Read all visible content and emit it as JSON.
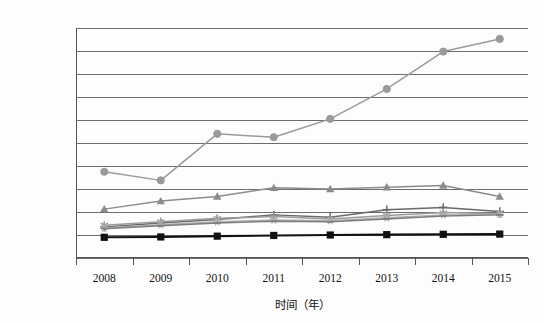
{
  "chart_data": {
    "type": "line",
    "title": "",
    "xlabel": "时间（年）",
    "ylabel": "",
    "categories": [
      "2008",
      "2009",
      "2010",
      "2011",
      "2012",
      "2013",
      "2014",
      "2015"
    ],
    "ylim": [
      0,
      20000
    ],
    "ytick_step": 2000,
    "ytick_labels": [
      "0",
      "2 000",
      "4 000",
      "6 000",
      "8 000",
      "10 000",
      "12 000",
      "14 000",
      "16 000",
      "18 000",
      "20 000"
    ],
    "grid": true,
    "legend_position": "none",
    "series": [
      {
        "name": "series-circle",
        "marker": "circle",
        "color": "#9a9a9a",
        "values": [
          7500,
          6750,
          10800,
          10500,
          12100,
          14700,
          17950,
          19050
        ]
      },
      {
        "name": "series-triangle",
        "marker": "triangle",
        "color": "#8c8c8c",
        "values": [
          4250,
          4950,
          5350,
          6100,
          6000,
          6150,
          6300,
          5350
        ]
      },
      {
        "name": "series-plus",
        "marker": "plus",
        "color": "#6a6a6a",
        "values": [
          2700,
          3050,
          3350,
          3750,
          3550,
          4200,
          4400,
          4050
        ]
      },
      {
        "name": "series-star",
        "marker": "star",
        "color": "#9c9c9c",
        "values": [
          2850,
          3150,
          3450,
          3600,
          3400,
          3700,
          3950,
          3850
        ]
      },
      {
        "name": "series-asterisk",
        "marker": "asterisk",
        "color": "#b0b0b0",
        "values": [
          2600,
          2900,
          3150,
          3300,
          3250,
          3500,
          3750,
          3800
        ]
      },
      {
        "name": "series-dash",
        "marker": "tick",
        "color": "#7d7d7d",
        "values": [
          2550,
          2800,
          3050,
          3200,
          3150,
          3400,
          3650,
          3750
        ]
      },
      {
        "name": "series-square",
        "marker": "square",
        "color": "#111111",
        "values": [
          1800,
          1830,
          1900,
          1960,
          2000,
          2030,
          2060,
          2080
        ]
      }
    ]
  }
}
